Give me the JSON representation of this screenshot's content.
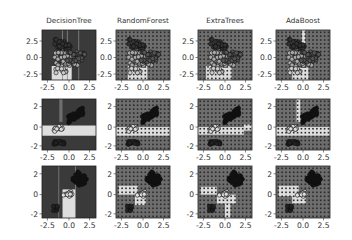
{
  "chart_data": {
    "type": "scatter",
    "layout": "grid 3x4",
    "columns": [
      "DecisionTree",
      "RandomForest",
      "ExtraTrees",
      "AdaBoost"
    ],
    "rows": [
      {
        "features": "pair 0",
        "xticks": [
          "-2.5",
          "0.0",
          "2.5"
        ],
        "yticks": [
          "2.5",
          "0.0",
          "-2.5"
        ],
        "xlim": [
          -3.0,
          3.6
        ],
        "ylim": [
          -3.3,
          4.2
        ]
      },
      {
        "features": "pair 1",
        "xticks": [
          "-2.5",
          "0.0",
          "2.5"
        ],
        "yticks": [
          "2",
          "0",
          "-2"
        ],
        "xlim": [
          -3.0,
          3.6
        ],
        "ylim": [
          -2.4,
          2.8
        ]
      },
      {
        "features": "pair 2",
        "xticks": [
          "-2.5",
          "0.0",
          "2.5"
        ],
        "yticks": [
          "2",
          "0",
          "-2"
        ],
        "xlim": [
          -2.8,
          2.8
        ],
        "ylim": [
          -2.4,
          2.7
        ]
      }
    ],
    "grid": false,
    "legend": null,
    "title": "",
    "xlabel": "",
    "ylabel": "",
    "colors": {
      "dark_region": "#3a3a3a",
      "mid_region": "#6e6e6e",
      "light_region": "#dedede",
      "marker_edge": "#111111"
    }
  }
}
